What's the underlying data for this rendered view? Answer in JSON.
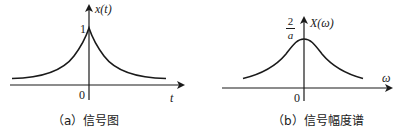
{
  "panels": [
    {
      "id": "a",
      "y_axis_label": "x(t)",
      "x_axis_label": "t",
      "origin_label": "0",
      "peak_label": "1",
      "caption": "（a）信号图",
      "curve": "two-sided exponential e^{-a|t|}"
    },
    {
      "id": "b",
      "y_axis_label": "X(ω)",
      "x_axis_label": "ω",
      "origin_label": "0",
      "peak_label_num": "2",
      "peak_label_den": "a",
      "caption": "（b）信号幅度谱",
      "curve": "Lorentzian 2a/(a²+ω²)"
    }
  ],
  "colors": {
    "stroke": "#1a1a1a",
    "background": "#ffffff"
  }
}
